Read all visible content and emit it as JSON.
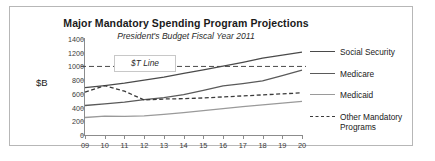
{
  "chart_data": {
    "type": "line",
    "title": "Major Mandatory Spending Program Projections",
    "subtitle": "President's Budget Fiscal Year 2011",
    "ylabel": "$B",
    "xlabel": "",
    "categories": [
      "09",
      "10",
      "11",
      "12",
      "13",
      "14",
      "15",
      "16",
      "17",
      "18",
      "19",
      "20"
    ],
    "ylim": [
      0,
      1400
    ],
    "yticks": [
      1400,
      1200,
      1000,
      800,
      600,
      400,
      200,
      0
    ],
    "grid": false,
    "legend_position": "right",
    "series": [
      {
        "name": "Social Security",
        "style": "solid",
        "color": "#4a4a4a",
        "values": [
          690,
          720,
          755,
          800,
          845,
          900,
          950,
          1005,
          1060,
          1120,
          1165,
          1210
        ]
      },
      {
        "name": "Medicare",
        "style": "solid",
        "color": "#5a5a5a",
        "values": [
          430,
          455,
          480,
          515,
          545,
          590,
          650,
          715,
          750,
          790,
          865,
          945
        ]
      },
      {
        "name": "Medicaid",
        "style": "solid",
        "color": "#9a9a9a",
        "values": [
          255,
          275,
          272,
          278,
          300,
          325,
          355,
          385,
          415,
          440,
          465,
          490
        ]
      },
      {
        "name": "Other Mandatory Programs",
        "style": "dashed",
        "color": "#3a3a3a",
        "values": [
          625,
          720,
          640,
          510,
          525,
          530,
          540,
          555,
          570,
          585,
          600,
          615
        ]
      }
    ],
    "annotation": {
      "label": "$T Line",
      "value": 1000,
      "style": "dashed"
    }
  },
  "legend": {
    "items": [
      {
        "label": "Social Security"
      },
      {
        "label": "Medicare"
      },
      {
        "label": "Medicaid"
      },
      {
        "label": "Other Mandatory Programs"
      }
    ]
  }
}
